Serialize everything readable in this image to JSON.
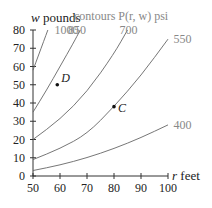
{
  "chart_data": {
    "type": "line",
    "title": "contours P(r, w) psi",
    "xlabel": "r feet",
    "ylabel": "w pounds",
    "xlim": [
      50,
      100
    ],
    "ylim": [
      0,
      80
    ],
    "xticks": [
      50,
      60,
      70,
      80,
      90,
      100
    ],
    "yticks": [
      0,
      10,
      20,
      30,
      40,
      50,
      60,
      70,
      80
    ],
    "grid": false,
    "series": [
      {
        "name": "1000",
        "label_pos": [
          58,
          80
        ],
        "points": [
          [
            50,
            58
          ],
          [
            52,
            66
          ],
          [
            54,
            74
          ],
          [
            55.5,
            80
          ]
        ]
      },
      {
        "name": "850",
        "label_pos": [
          63,
          80
        ],
        "points": [
          [
            50,
            35
          ],
          [
            55,
            47
          ],
          [
            60,
            60
          ],
          [
            65,
            73
          ],
          [
            67.5,
            80
          ]
        ]
      },
      {
        "name": "700",
        "label_pos": [
          82,
          80
        ],
        "points": [
          [
            50,
            20
          ],
          [
            60,
            31
          ],
          [
            70,
            46
          ],
          [
            80,
            67
          ],
          [
            85,
            80
          ]
        ]
      },
      {
        "name": "550",
        "label_pos": [
          102,
          75
        ],
        "points": [
          [
            50,
            9
          ],
          [
            60,
            15
          ],
          [
            70,
            23
          ],
          [
            80,
            38
          ],
          [
            90,
            55
          ],
          [
            100,
            75
          ]
        ]
      },
      {
        "name": "400",
        "label_pos": [
          102,
          28
        ],
        "points": [
          [
            50,
            3
          ],
          [
            60,
            6
          ],
          [
            70,
            10
          ],
          [
            80,
            15
          ],
          [
            90,
            21
          ],
          [
            100,
            28
          ]
        ]
      }
    ],
    "annotations": [
      {
        "label": "D",
        "r": 59,
        "w": 50
      },
      {
        "label": "C",
        "r": 80,
        "w": 38
      }
    ]
  },
  "labels": {
    "title": "contours P(r, w) psi",
    "ylabel_var": "w",
    "ylabel_unit": " pounds",
    "xlabel_var": "r",
    "xlabel_unit": " feet"
  }
}
